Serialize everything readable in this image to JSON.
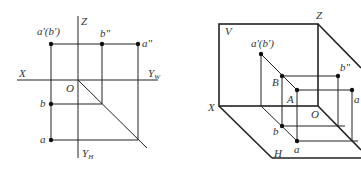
{
  "left_diagram": {
    "title": "Three-view projection (orthographic unfolding)",
    "labels": {
      "z_axis": "Z",
      "x_axis": "X",
      "y_w_axis": "Y",
      "y_w_sub": "W",
      "y_h_axis": "Y",
      "y_h_sub": "H",
      "origin": "O",
      "front_proj": "a'(b')",
      "side_b": "b\"",
      "side_a": "a\"",
      "top_b": "b",
      "top_a": "a"
    }
  },
  "right_diagram": {
    "title": "Three-plane projection system (isometric view)",
    "labels": {
      "v_plane": "V",
      "h_plane": "H",
      "z_axis": "Z",
      "x_axis": "X",
      "origin": "O",
      "front_proj": "a'(b')",
      "point_B": "B",
      "point_A": "A",
      "side_b": "b\"",
      "side_a": "a",
      "top_b": "b",
      "top_a": "a"
    }
  },
  "colors": {
    "line": "#222222",
    "text": "#333333",
    "background": "#ffffff"
  }
}
